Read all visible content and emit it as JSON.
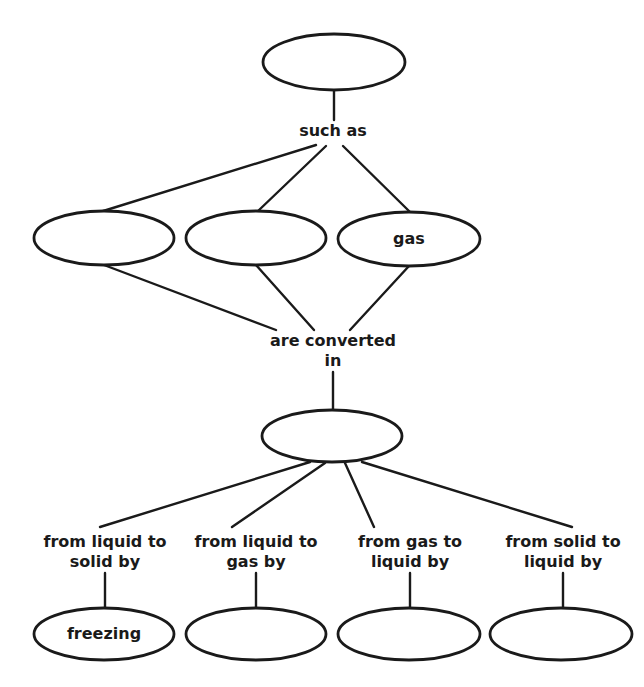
{
  "diagram": {
    "type": "concept-map",
    "nodes": [
      {
        "id": "root",
        "text": "",
        "cx": 334,
        "cy": 62,
        "rx": 71,
        "ry": 28
      },
      {
        "id": "state1",
        "text": "",
        "cx": 104,
        "cy": 238,
        "rx": 70,
        "ry": 27
      },
      {
        "id": "state2",
        "text": "",
        "cx": 256,
        "cy": 238,
        "rx": 70,
        "ry": 27
      },
      {
        "id": "state3",
        "text": "gas",
        "cx": 409,
        "cy": 239,
        "rx": 71,
        "ry": 27
      },
      {
        "id": "process",
        "text": "",
        "cx": 332,
        "cy": 436,
        "rx": 70,
        "ry": 26
      },
      {
        "id": "change1",
        "text": "freezing",
        "cx": 104,
        "cy": 634,
        "rx": 70,
        "ry": 26
      },
      {
        "id": "change2",
        "text": "",
        "cx": 256,
        "cy": 634,
        "rx": 70,
        "ry": 26
      },
      {
        "id": "change3",
        "text": "",
        "cx": 409,
        "cy": 634,
        "rx": 71,
        "ry": 26
      },
      {
        "id": "change4",
        "text": "",
        "cx": 561,
        "cy": 634,
        "rx": 71,
        "ry": 26
      }
    ],
    "links": [
      {
        "id": "such_as",
        "lines": [
          "such as"
        ],
        "x": 333,
        "y": 121
      },
      {
        "id": "are_converted_in",
        "lines": [
          "are converted",
          "in"
        ],
        "x": 333,
        "y": 331
      },
      {
        "id": "liquid_to_solid",
        "lines": [
          "from liquid to",
          "solid by"
        ],
        "x": 105,
        "y": 532
      },
      {
        "id": "liquid_to_gas",
        "lines": [
          "from liquid to",
          "gas by"
        ],
        "x": 256,
        "y": 532
      },
      {
        "id": "gas_to_liquid",
        "lines": [
          "from gas to",
          "liquid by"
        ],
        "x": 410,
        "y": 532
      },
      {
        "id": "solid_to_liquid",
        "lines": [
          "from solid to",
          "liquid by"
        ],
        "x": 563,
        "y": 532
      }
    ],
    "edges": [
      [
        334,
        90,
        334,
        120
      ],
      [
        316,
        145,
        100,
        212
      ],
      [
        326,
        146,
        258,
        211
      ],
      [
        343,
        146,
        410,
        212
      ],
      [
        104,
        265,
        276,
        330
      ],
      [
        256,
        265,
        314,
        330
      ],
      [
        409,
        266,
        350,
        330
      ],
      [
        333,
        372,
        333,
        410
      ],
      [
        310,
        462,
        100,
        527
      ],
      [
        325,
        463,
        232,
        527
      ],
      [
        345,
        463,
        374,
        527
      ],
      [
        362,
        462,
        572,
        527
      ],
      [
        105,
        573,
        105,
        608
      ],
      [
        256,
        573,
        256,
        608
      ],
      [
        410,
        573,
        410,
        608
      ],
      [
        563,
        573,
        563,
        608
      ]
    ],
    "stroke_color": "#1a1a1a",
    "background": "#ffffff"
  }
}
